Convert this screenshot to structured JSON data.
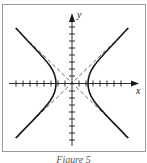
{
  "figure": {
    "caption": "Figure 5",
    "axis_labels": {
      "x": "x",
      "y": "y"
    },
    "colors": {
      "frame": "#9a9a9a",
      "ink": "#1a1a1a",
      "dash": "#444444"
    }
  },
  "diagram": {
    "type": "hyperbola",
    "x_ticks_each_side": 8,
    "y_ticks_each_side": 9,
    "asymptotes": "dashed diagonal lines through origin"
  }
}
